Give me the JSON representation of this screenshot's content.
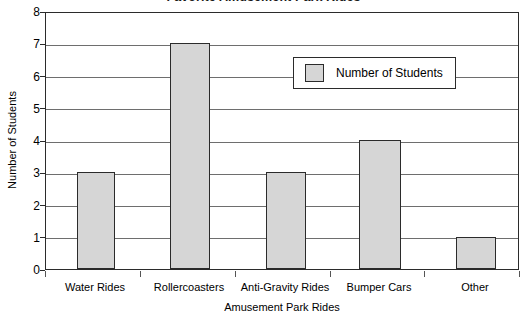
{
  "chart_data": {
    "type": "bar",
    "title": "Favorite Amusement Park Rides",
    "xlabel": "Amusement Park Rides",
    "ylabel": "Number of Students",
    "categories": [
      "Water Rides",
      "Rollercoasters",
      "Anti-Gravity Rides",
      "Bumper Cars",
      "Other"
    ],
    "values": [
      3,
      7,
      3,
      4,
      1
    ],
    "series": [
      {
        "name": "Number of Students",
        "values": [
          3,
          7,
          3,
          4,
          1
        ]
      }
    ],
    "ylim": [
      0,
      8
    ],
    "ytick_labels": [
      "8",
      "7",
      "6",
      "5",
      "4",
      "3",
      "2",
      "1",
      "0"
    ],
    "ytick_values": [
      8,
      7,
      6,
      5,
      4,
      3,
      2,
      1,
      0
    ],
    "grid": "horizontal",
    "legend_position": "upper-right-inside",
    "legend_entries": [
      "Number of Students"
    ],
    "colors": {
      "bar_fill": "#d6d6d6",
      "bar_border": "#2b2b2b",
      "gridline": "#6e6e6e",
      "axis": "#2b2b2b",
      "background": "#ffffff",
      "text": "#000000"
    }
  }
}
